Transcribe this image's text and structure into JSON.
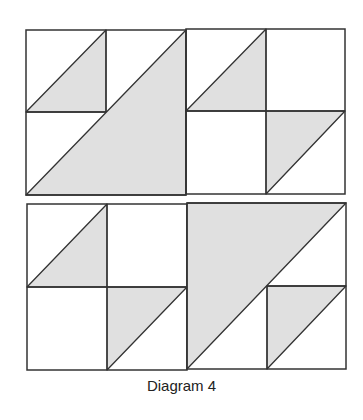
{
  "caption": "Diagram 4",
  "colors": {
    "fill": "#e0e0e0",
    "stroke": "#333333",
    "background": "#ffffff"
  },
  "blocks": [
    {
      "name": "top-left-block",
      "x": 26,
      "y": 30,
      "w": 160,
      "h": 165,
      "lines": [
        [
          106,
          30,
          106,
          112
        ],
        [
          26,
          112,
          106,
          112
        ]
      ],
      "triangles": [
        [
          [
            26,
            112
          ],
          [
            106,
            30
          ],
          [
            106,
            112
          ]
        ],
        [
          [
            26,
            195
          ],
          [
            186,
            30
          ],
          [
            186,
            195
          ]
        ]
      ]
    },
    {
      "name": "top-right-block",
      "x": 186,
      "y": 29,
      "w": 159,
      "h": 165,
      "lines": [
        [
          266,
          29,
          266,
          194
        ],
        [
          186,
          111,
          345,
          111
        ]
      ],
      "triangles": [
        [
          [
            186,
            111
          ],
          [
            266,
            29
          ],
          [
            266,
            111
          ]
        ],
        [
          [
            266,
            111
          ],
          [
            345,
            111
          ],
          [
            266,
            194
          ]
        ]
      ]
    },
    {
      "name": "bottom-left-block",
      "x": 27,
      "y": 204,
      "w": 160,
      "h": 166,
      "lines": [
        [
          107,
          204,
          107,
          370
        ],
        [
          27,
          287,
          187,
          287
        ]
      ],
      "triangles": [
        [
          [
            27,
            287
          ],
          [
            107,
            204
          ],
          [
            107,
            287
          ]
        ],
        [
          [
            107,
            287
          ],
          [
            187,
            287
          ],
          [
            107,
            370
          ]
        ]
      ]
    },
    {
      "name": "bottom-right-block",
      "x": 187,
      "y": 203,
      "w": 159,
      "h": 166,
      "lines": [
        [
          267,
          286,
          267,
          369
        ],
        [
          267,
          286,
          346,
          286
        ]
      ],
      "triangles": [
        [
          [
            187,
            203
          ],
          [
            346,
            203
          ],
          [
            187,
            369
          ]
        ],
        [
          [
            267,
            286
          ],
          [
            346,
            286
          ],
          [
            267,
            369
          ]
        ]
      ]
    }
  ]
}
